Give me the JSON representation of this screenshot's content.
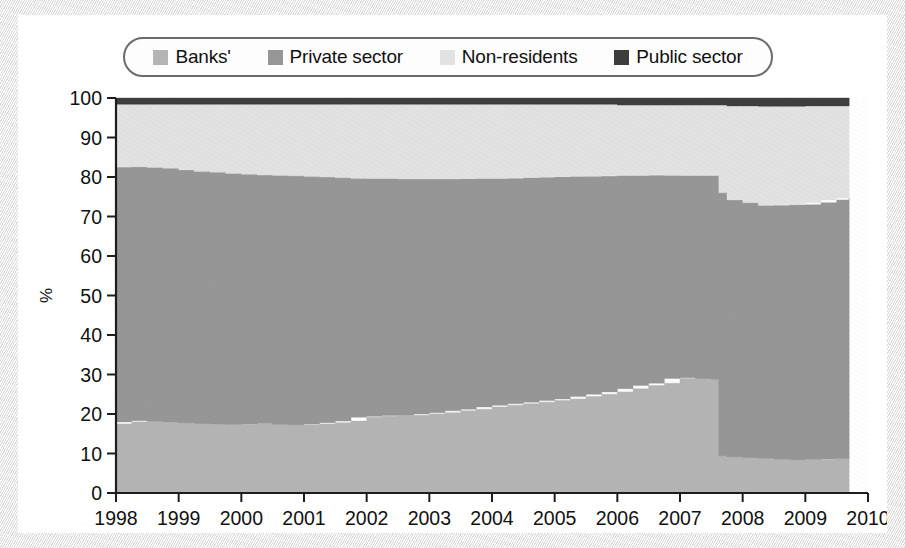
{
  "figure": {
    "card_background": "#ffffff",
    "page_background": "#f0f0f0",
    "clipped_header_text": ""
  },
  "legend": {
    "items": [
      {
        "label": "Banks'",
        "color": "#b4b4b4",
        "icon": "legend-swatch-icon"
      },
      {
        "label": "Private sector",
        "color": "#969696",
        "icon": "legend-swatch-icon"
      },
      {
        "label": "Non-residents",
        "color": "#e2e2e2",
        "icon": "legend-swatch-icon"
      },
      {
        "label": "Public sector",
        "color": "#3d3d3d",
        "icon": "legend-swatch-icon"
      }
    ]
  },
  "chart_data": {
    "type": "area",
    "stacked": true,
    "stack_total": 100,
    "title": "",
    "subtitle": "",
    "xlabel": "",
    "ylabel": "%",
    "xlim": [
      1998,
      2010
    ],
    "ylim": [
      0,
      100
    ],
    "grid": false,
    "legend_position": "top",
    "yticks": [
      0,
      10,
      20,
      30,
      40,
      50,
      60,
      70,
      80,
      90,
      100
    ],
    "ytick_labels": [
      "0",
      "10",
      "20",
      "30",
      "40",
      "50",
      "60",
      "70",
      "80",
      "90",
      "100"
    ],
    "xticks": [
      1998,
      1999,
      2000,
      2001,
      2002,
      2003,
      2004,
      2005,
      2006,
      2007,
      2008,
      2009,
      2010
    ],
    "xtick_labels": [
      "1998",
      "1999",
      "2000",
      "2001",
      "2002",
      "2003",
      "2004",
      "2005",
      "2006",
      "2007",
      "2008",
      "2009",
      "2010"
    ],
    "x_note": "quarterly/monthly observations from 1998.0 to 2009.7",
    "x": [
      1998.0,
      1998.25,
      1998.5,
      1998.75,
      1999.0,
      1999.25,
      1999.5,
      1999.75,
      2000.0,
      2000.25,
      2000.5,
      2000.75,
      2001.0,
      2001.25,
      2001.5,
      2001.75,
      2002.0,
      2002.25,
      2002.5,
      2002.75,
      2003.0,
      2003.25,
      2003.5,
      2003.75,
      2004.0,
      2004.25,
      2004.5,
      2004.75,
      2005.0,
      2005.25,
      2005.5,
      2005.75,
      2006.0,
      2006.25,
      2006.5,
      2006.75,
      2007.0,
      2007.25,
      2007.5,
      2007.62,
      2007.75,
      2008.0,
      2008.25,
      2008.5,
      2008.75,
      2009.0,
      2009.25,
      2009.5,
      2009.7
    ],
    "series": [
      {
        "name": "Banks'",
        "color": "#b4b4b4",
        "stack_order": 1,
        "values": [
          17.5,
          18.0,
          18.3,
          18.2,
          18.0,
          17.8,
          17.6,
          17.5,
          17.4,
          17.5,
          17.6,
          17.4,
          17.3,
          17.5,
          17.8,
          18.2,
          19.2,
          19.4,
          19.6,
          19.7,
          20.0,
          20.3,
          20.8,
          21.2,
          21.8,
          22.2,
          22.6,
          23.0,
          23.4,
          23.8,
          24.4,
          25.0,
          25.6,
          26.4,
          27.2,
          27.8,
          29.0,
          29.2,
          29.0,
          28.8,
          9.4,
          9.2,
          9.0,
          8.8,
          8.6,
          8.4,
          8.5,
          8.6,
          8.7
        ]
      },
      {
        "name": "Private sector",
        "color": "#969696",
        "stack_order": 2,
        "values": [
          65.0,
          64.6,
          64.3,
          64.2,
          64.2,
          64.0,
          63.8,
          63.7,
          63.5,
          63.2,
          62.9,
          63.0,
          63.0,
          62.6,
          62.2,
          61.6,
          60.4,
          60.2,
          60.0,
          59.8,
          59.5,
          59.2,
          58.7,
          58.4,
          57.8,
          57.4,
          57.2,
          56.9,
          56.6,
          56.3,
          55.8,
          55.2,
          54.8,
          54.0,
          53.2,
          52.8,
          51.4,
          51.2,
          51.4,
          51.6,
          66.6,
          65.0,
          64.5,
          64.0,
          64.4,
          64.6,
          65.0,
          65.6,
          66.0
        ]
      },
      {
        "name": "Non-residents",
        "color": "#e2e2e2",
        "stack_order": 3,
        "values": [
          15.9,
          15.8,
          15.8,
          16.0,
          16.2,
          16.6,
          17.0,
          17.2,
          17.5,
          17.7,
          17.9,
          18.0,
          18.1,
          18.3,
          18.4,
          18.6,
          18.8,
          18.8,
          18.8,
          18.9,
          18.9,
          18.9,
          18.9,
          18.8,
          18.8,
          18.8,
          18.6,
          18.5,
          18.4,
          18.3,
          18.2,
          18.2,
          18.0,
          17.8,
          17.8,
          17.6,
          17.8,
          17.8,
          17.8,
          17.8,
          22.2,
          23.8,
          24.5,
          25.1,
          24.9,
          24.9,
          24.5,
          23.8,
          23.3
        ]
      },
      {
        "name": "Public sector",
        "color": "#3d3d3d",
        "stack_order": 4,
        "values": [
          1.6,
          1.6,
          1.6,
          1.6,
          1.6,
          1.6,
          1.6,
          1.6,
          1.6,
          1.6,
          1.6,
          1.6,
          1.6,
          1.6,
          1.6,
          1.6,
          1.6,
          1.6,
          1.6,
          1.6,
          1.6,
          1.6,
          1.6,
          1.6,
          1.6,
          1.6,
          1.6,
          1.6,
          1.6,
          1.6,
          1.6,
          1.6,
          1.6,
          1.8,
          1.8,
          1.8,
          1.8,
          1.8,
          1.8,
          1.8,
          1.8,
          2.0,
          2.0,
          2.1,
          2.1,
          2.1,
          2.0,
          2.0,
          2.0
        ]
      }
    ]
  }
}
